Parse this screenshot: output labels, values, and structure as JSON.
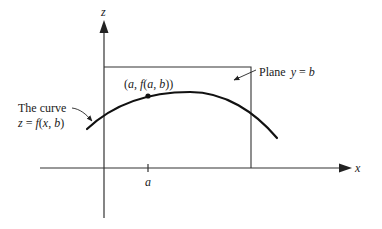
{
  "figure": {
    "axes": {
      "z_label": "z",
      "x_label": "x",
      "tick_label": "a"
    },
    "labels": {
      "point": [
        "(",
        "a",
        ", ",
        "f",
        "(",
        "a",
        ", ",
        "b",
        "))"
      ],
      "point_text": "(a, f(a, b))",
      "plane_word": "Plane",
      "plane_eq_lhs": "y",
      "plane_eq_op": " = ",
      "plane_eq_rhs": "b",
      "curve_line1": "The curve",
      "curve_eq_z": "z",
      "curve_eq_op": " = ",
      "curve_eq_f": "f",
      "curve_eq_args_open": "(",
      "curve_eq_x": "x",
      "curve_eq_comma": ", ",
      "curve_eq_b": "b",
      "curve_eq_close": ")"
    },
    "colors": {
      "ink": "#111111",
      "axis": "#333333",
      "background": "#ffffff"
    }
  }
}
